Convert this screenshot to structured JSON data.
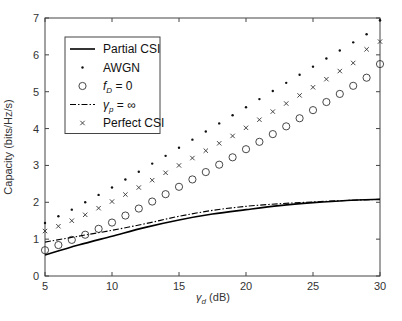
{
  "chart_data": {
    "type": "line",
    "title": "",
    "xlabel": "γd (dB)",
    "xlabel_symbol": "γ",
    "xlabel_sub": "d",
    "xlabel_unit": " (dB)",
    "ylabel": "Capacity (bits/Hz/s)",
    "xlim": [
      5,
      30
    ],
    "ylim": [
      0,
      7
    ],
    "xticks": [
      5,
      10,
      15,
      20,
      25,
      30
    ],
    "yticks": [
      0,
      1,
      2,
      3,
      4,
      5,
      6,
      7
    ],
    "grid": false,
    "legend_position": "upper left",
    "series": [
      {
        "name": "Partial CSI",
        "style": "solid-line",
        "x": [
          5,
          7.5,
          10,
          12.5,
          15,
          17.5,
          20,
          22.5,
          25,
          27.5,
          30
        ],
        "values": [
          0.57,
          0.84,
          1.08,
          1.32,
          1.52,
          1.68,
          1.8,
          1.91,
          1.99,
          2.05,
          2.08
        ]
      },
      {
        "name": "AWGN",
        "style": "dot-marker",
        "x": [
          5,
          6,
          7,
          8,
          9,
          10,
          11,
          12,
          13,
          14,
          15,
          16,
          17,
          18,
          19,
          20,
          21,
          22,
          23,
          24,
          25,
          26,
          27,
          28,
          29,
          30
        ],
        "values": [
          1.44,
          1.62,
          1.8,
          2.0,
          2.2,
          2.4,
          2.62,
          2.83,
          3.05,
          3.26,
          3.48,
          3.7,
          3.92,
          4.14,
          4.36,
          4.58,
          4.8,
          5.02,
          5.24,
          5.46,
          5.68,
          5.9,
          6.12,
          6.34,
          6.56,
          6.94
        ]
      },
      {
        "name": "f_D = 0",
        "label_main": "f",
        "label_sub": "D",
        "label_rest": " = 0",
        "style": "circle-marker",
        "x": [
          5,
          6,
          7,
          8,
          9,
          10,
          11,
          12,
          13,
          14,
          15,
          16,
          17,
          18,
          19,
          20,
          21,
          22,
          23,
          24,
          25,
          26,
          27,
          28,
          29,
          30
        ],
        "values": [
          0.7,
          0.84,
          0.98,
          1.12,
          1.28,
          1.45,
          1.64,
          1.83,
          2.02,
          2.22,
          2.42,
          2.62,
          2.82,
          3.02,
          3.22,
          3.44,
          3.64,
          3.85,
          4.06,
          4.28,
          4.5,
          4.72,
          4.94,
          5.16,
          5.38,
          5.75
        ]
      },
      {
        "name": "γp = ∞",
        "label_main": "γ",
        "label_sub": "p",
        "label_rest": " = ∞",
        "style": "dash-dot-line",
        "x": [
          5,
          7.5,
          10,
          12.5,
          15,
          17.5,
          20,
          22.5,
          25,
          27.5,
          30
        ],
        "values": [
          0.92,
          1.08,
          1.24,
          1.42,
          1.62,
          1.78,
          1.89,
          1.96,
          2.01,
          2.05,
          2.08
        ]
      },
      {
        "name": "Perfect CSI",
        "style": "cross-marker",
        "x": [
          5,
          6,
          7,
          8,
          9,
          10,
          11,
          12,
          13,
          14,
          15,
          16,
          17,
          18,
          19,
          20,
          21,
          22,
          23,
          24,
          25,
          26,
          27,
          28,
          29,
          30
        ],
        "values": [
          1.22,
          1.35,
          1.5,
          1.66,
          1.84,
          2.02,
          2.21,
          2.4,
          2.6,
          2.8,
          3.0,
          3.2,
          3.4,
          3.6,
          3.8,
          4.02,
          4.24,
          4.46,
          4.68,
          4.9,
          5.12,
          5.34,
          5.56,
          5.78,
          6.15,
          6.36
        ]
      }
    ]
  }
}
